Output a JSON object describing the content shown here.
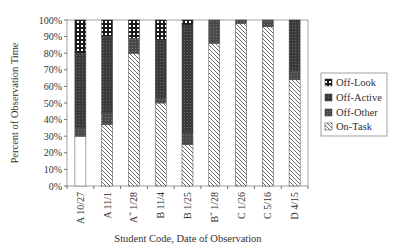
{
  "chart_data": {
    "type": "bar",
    "stacked": true,
    "percent_stacked": true,
    "title": "",
    "xlabel": "Student Code, Date of Observation",
    "ylabel": "Percent of Observation Time",
    "ylim": [
      0,
      100
    ],
    "yticks": [
      "0%",
      "10%",
      "20%",
      "30%",
      "40%",
      "50%",
      "60%",
      "70%",
      "80%",
      "90%",
      "100%"
    ],
    "grid": false,
    "legend_position": "right",
    "categories": [
      "A 10/27",
      "A 11/1",
      "A* 1/28",
      "B 11/4",
      "B 1/25",
      "B* 1/28",
      "C 1/26",
      "C 5/16",
      "D 4/15"
    ],
    "category_labels": [
      {
        "code": "A",
        "sup": "",
        "date": "10/27"
      },
      {
        "code": "A",
        "sup": "",
        "date": "11/1"
      },
      {
        "code": "A",
        "sup": "*",
        "date": "1/28"
      },
      {
        "code": "B",
        "sup": "",
        "date": "11/4"
      },
      {
        "code": "B",
        "sup": "",
        "date": "1/25"
      },
      {
        "code": "B",
        "sup": "*",
        "date": "1/28"
      },
      {
        "code": "C",
        "sup": "",
        "date": "1/26"
      },
      {
        "code": "C",
        "sup": "",
        "date": "5/16"
      },
      {
        "code": "D",
        "sup": "",
        "date": "4/15"
      }
    ],
    "series": [
      {
        "name": "On-Task",
        "pattern": "hatch",
        "values": [
          30,
          37,
          80,
          50,
          25,
          86,
          98,
          96,
          64
        ]
      },
      {
        "name": "Off-Other",
        "pattern": "dark-grid",
        "values": [
          5,
          7,
          9,
          3,
          7,
          14,
          2,
          4,
          5
        ]
      },
      {
        "name": "Off-Active",
        "pattern": "darker-grid",
        "values": [
          45,
          46,
          0,
          35,
          65,
          0,
          0,
          0,
          31
        ]
      },
      {
        "name": "Off-Look",
        "pattern": "white-dots",
        "values": [
          20,
          10,
          11,
          12,
          3,
          0,
          0,
          0,
          0
        ]
      }
    ]
  },
  "legend": {
    "items": [
      "Off-Look",
      "Off-Active",
      "Off-Other",
      "On-Task"
    ]
  }
}
